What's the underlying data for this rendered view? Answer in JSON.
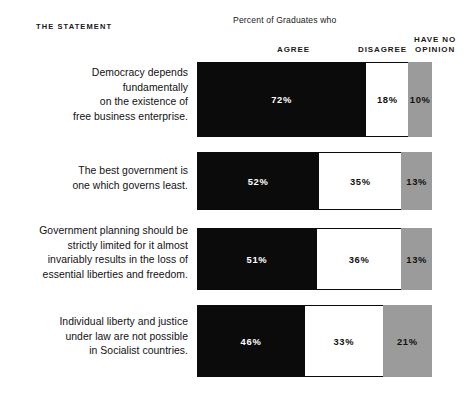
{
  "header": {
    "statement_label": "THE STATEMENT",
    "supertitle": "Percent of Graduates who",
    "col_agree": "AGREE",
    "col_disagree": "DISAGREE",
    "col_no_opinion_line1": "HAVE NO",
    "col_no_opinion_line2": "OPINION"
  },
  "colors": {
    "agree": "#0b0b0b",
    "disagree": "#ffffff",
    "no_opinion": "#9b9b9b",
    "background": "#ffffff",
    "text": "#111111"
  },
  "rows": [
    {
      "statement": "Democracy depends\nfundamentally\non the existence of\nfree business enterprise.",
      "agree_label": "72%",
      "disagree_label": "18%",
      "no_opinion_label": "10%"
    },
    {
      "statement": "The best government is\none which governs least.",
      "agree_label": "52%",
      "disagree_label": "35%",
      "no_opinion_label": "13%"
    },
    {
      "statement": "Government planning should be\nstrictly limited for it almost\ninvariably results in the loss of\nessential liberties and freedom.",
      "agree_label": "51%",
      "disagree_label": "36%",
      "no_opinion_label": "13%"
    },
    {
      "statement": "Individual liberty and justice\nunder law are not possible\nin Socialist countries.",
      "agree_label": "46%",
      "disagree_label": "33%",
      "no_opinion_label": "21%"
    }
  ],
  "chart_data": {
    "type": "bar",
    "orientation": "horizontal",
    "stacked": true,
    "title": "Percent of Graduates who",
    "xlabel": "",
    "ylabel": "THE STATEMENT",
    "xlim": [
      0,
      100
    ],
    "grid": false,
    "legend_position": "top",
    "units": "percent",
    "categories": [
      "Democracy depends fundamentally on the existence of free business enterprise.",
      "The best government is one which governs least.",
      "Government planning should be strictly limited for it almost invariably results in the loss of essential liberties and freedom.",
      "Individual liberty and justice under law are not possible in Socialist countries."
    ],
    "series": [
      {
        "name": "AGREE",
        "color": "#0b0b0b",
        "values": [
          72,
          52,
          51,
          46
        ]
      },
      {
        "name": "DISAGREE",
        "color": "#ffffff",
        "values": [
          18,
          35,
          36,
          33
        ]
      },
      {
        "name": "HAVE NO OPINION",
        "color": "#9b9b9b",
        "values": [
          10,
          13,
          13,
          21
        ]
      }
    ]
  },
  "layout": {
    "bar_left": 197,
    "bar_width": 235,
    "rows_geometry": [
      {
        "bar_top": 62,
        "bar_height": 75,
        "text_top": 66
      },
      {
        "bar_top": 152,
        "bar_height": 58,
        "text_top": 164
      },
      {
        "bar_top": 228,
        "bar_height": 62,
        "text_top": 224
      },
      {
        "bar_top": 305,
        "bar_height": 72,
        "text_top": 315
      }
    ]
  }
}
